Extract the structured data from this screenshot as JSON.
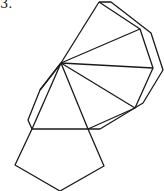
{
  "figure": {
    "label": "3.",
    "stroke_color": "#1a1a1a",
    "background": "#ffffff"
  }
}
